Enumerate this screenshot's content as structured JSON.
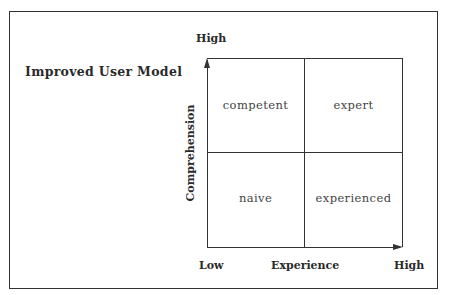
{
  "diagram": {
    "title": "Improved User Model",
    "y_axis": {
      "label": "Comprehension",
      "high": "High"
    },
    "x_axis": {
      "label": "Experience",
      "low": "Low",
      "high": "High"
    },
    "quadrants": {
      "top_left": "competent",
      "top_right": "expert",
      "bottom_left": "naive",
      "bottom_right": "experienced"
    }
  }
}
